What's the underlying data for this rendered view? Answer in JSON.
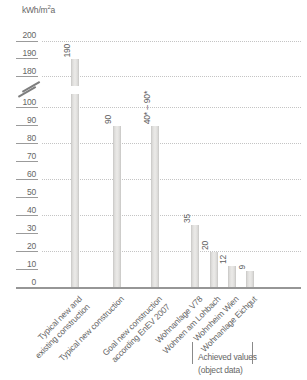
{
  "unit_label": {
    "prefix": "kWh/m",
    "sup": "2",
    "suffix": "a"
  },
  "colors": {
    "text": "#666666",
    "tick": "#9b9b9b",
    "gridline": "#c4c4c4",
    "baseline": "#969696",
    "bar_edge": "#c7c6c4",
    "bar_center": "#ebeae8"
  },
  "chart_data": {
    "type": "bar",
    "title": "",
    "ylabel": "kWh/m²a",
    "xlabel": "",
    "yticks": [
      200,
      190,
      180,
      100,
      90,
      80,
      70,
      60,
      50,
      40,
      30,
      20,
      10,
      0
    ],
    "dashed_gridline_values": [
      200,
      180,
      100,
      80,
      60,
      40,
      20
    ],
    "axis_break": {
      "between": [
        100,
        180
      ]
    },
    "ylim_segments": [
      [
        0,
        100
      ],
      [
        180,
        200
      ]
    ],
    "grid": "dotted horizontal",
    "legend": "none",
    "bars": [
      {
        "category": "Typical new and existing construction",
        "category_lines": [
          "Typical new and",
          "existing construction"
        ],
        "value": 190,
        "value_label": "190"
      },
      {
        "category": "Typical new construction",
        "category_lines": [
          "Typical new construction"
        ],
        "value": 90,
        "value_label": "90"
      },
      {
        "category": "Goal new construction according EnEV 2007",
        "category_lines": [
          "Goal new construction",
          "according EnEV 2007"
        ],
        "value": 90,
        "value_label": "40* – 90*"
      },
      {
        "category": "Wohnanlage V78",
        "category_lines": [
          "Wohnanlage V78"
        ],
        "value": 35,
        "value_label": "35"
      },
      {
        "category": "Wohnen am Lohbach",
        "category_lines": [
          "Wohnen am Lohbach"
        ],
        "value": 20,
        "value_label": "20"
      },
      {
        "category": "Wohnheim Wien",
        "category_lines": [
          "Wohnheim Wien"
        ],
        "value": 12,
        "value_label": "12"
      },
      {
        "category": "Wohnanlage Eichgut",
        "category_lines": [
          "Wohnanlage Eichgut"
        ],
        "value": 9,
        "value_label": "9"
      }
    ],
    "bracket_annotation": {
      "lines": [
        "Achieved values",
        "(object data)"
      ],
      "applies_to": [
        "Wohnanlage V78",
        "Wohnen am Lohbach",
        "Wohnheim Wien",
        "Wohnanlage Eichgut"
      ]
    }
  }
}
